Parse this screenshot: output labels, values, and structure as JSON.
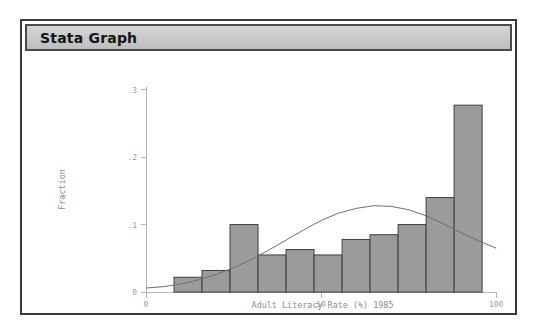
{
  "window": {
    "title": "Stata Graph"
  },
  "chart_data": {
    "type": "bar",
    "title": "",
    "xlabel": "Adult Literacy Rate (%) 1985",
    "ylabel": "Fraction",
    "xlim": [
      0,
      100
    ],
    "ylim": [
      0,
      0.31
    ],
    "xticks": [
      0,
      50,
      100
    ],
    "xtick_labels": [
      "0",
      "50",
      "100"
    ],
    "yticks": [
      0,
      0.1,
      0.2,
      0.3
    ],
    "ytick_labels": [
      "0",
      ".1",
      ".2",
      ".3"
    ],
    "grid": false,
    "legend": "none",
    "bar_fill_color": "#9b9b9b",
    "bar_edge_color": "#3d3d3d",
    "curve_color": "#6f6f6f",
    "bin_width": 8,
    "bin_starts": [
      8,
      16,
      24,
      32,
      40,
      48,
      56,
      64,
      72,
      80,
      88
    ],
    "bin_ends": [
      16,
      24,
      32,
      40,
      48,
      56,
      64,
      72,
      80,
      88,
      96
    ],
    "categories": [
      "8-16",
      "16-24",
      "24-32",
      "32-40",
      "40-48",
      "48-56",
      "56-64",
      "64-72",
      "72-80",
      "80-88",
      "88-96"
    ],
    "values": [
      0.022,
      0.032,
      0.1,
      0.055,
      0.063,
      0.055,
      0.078,
      0.085,
      0.1,
      0.14,
      0.277
    ],
    "overlay": {
      "name": "normal density",
      "type": "line",
      "mean": 66,
      "peak_x": 66,
      "peak_y": 0.128,
      "points_x": [
        0,
        5,
        10,
        15,
        20,
        25,
        30,
        35,
        40,
        45,
        50,
        55,
        60,
        65,
        70,
        75,
        80,
        85,
        90,
        95,
        100
      ],
      "points_y": [
        0.006,
        0.008,
        0.012,
        0.018,
        0.026,
        0.036,
        0.048,
        0.062,
        0.077,
        0.092,
        0.106,
        0.117,
        0.124,
        0.128,
        0.127,
        0.122,
        0.113,
        0.101,
        0.088,
        0.076,
        0.065
      ]
    }
  }
}
